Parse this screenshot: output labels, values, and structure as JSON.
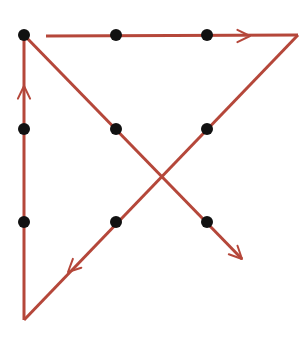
{
  "diagram": {
    "colors": {
      "line": "#b5473a",
      "dot": "#111111",
      "background": "#ffffff"
    },
    "grid": {
      "rows": 3,
      "cols": 3
    },
    "dots": [
      {
        "row": 0,
        "col": 0
      },
      {
        "row": 0,
        "col": 1
      },
      {
        "row": 0,
        "col": 2
      },
      {
        "row": 1,
        "col": 0
      },
      {
        "row": 1,
        "col": 1
      },
      {
        "row": 1,
        "col": 2
      },
      {
        "row": 2,
        "col": 0
      },
      {
        "row": 2,
        "col": 1
      },
      {
        "row": 2,
        "col": 2
      }
    ],
    "path": [
      {
        "from": "top-left-dot",
        "to": "beyond-top-right",
        "direction": "right",
        "arrow": "arrow-right"
      },
      {
        "from": "beyond-top-right",
        "to": "beyond-bottom-left",
        "direction": "down-left",
        "arrow": "arrow-down-left"
      },
      {
        "from": "beyond-bottom-left",
        "to": "top-left-dot",
        "direction": "up",
        "arrow": "arrow-up"
      },
      {
        "from": "top-left-dot",
        "to": "beyond-bottom-right",
        "direction": "down-right",
        "arrow": "arrow-down-right"
      }
    ],
    "line_count": 4
  }
}
